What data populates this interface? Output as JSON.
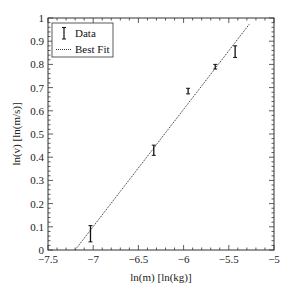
{
  "chart_data": {
    "type": "scatter",
    "title": "",
    "xlabel": "ln(m) [ln(kg)]",
    "ylabel": "ln(v) [ln(m/s)]",
    "xlim": [
      -7.5,
      -5
    ],
    "ylim": [
      0,
      1
    ],
    "x_ticks": [
      -7.5,
      -7,
      -6.5,
      -6,
      -5.5,
      -5
    ],
    "x_tick_labels": [
      "−7.5",
      "−7",
      "−6.5",
      "−6",
      "−5.5",
      "−5"
    ],
    "y_ticks": [
      0,
      0.1,
      0.2,
      0.3,
      0.4,
      0.5,
      0.6,
      0.7,
      0.8,
      0.9,
      1
    ],
    "y_tick_labels": [
      "0",
      "0.1",
      "0.2",
      "0.3",
      "0.4",
      "0.5",
      "0.6",
      "0.7",
      "0.8",
      "0.9",
      "1"
    ],
    "grid": false,
    "legend_position": "upper left",
    "series": [
      {
        "name": "Data",
        "style": "errorbar",
        "x": [
          -7.03,
          -6.33,
          -5.95,
          -5.65,
          -5.43
        ],
        "y": [
          0.07,
          0.43,
          0.685,
          0.79,
          0.855
        ],
        "yerr": [
          0.035,
          0.022,
          0.012,
          0.01,
          0.025
        ]
      },
      {
        "name": "Best Fit",
        "style": "dotted-line",
        "x": [
          -7.2,
          -5.27
        ],
        "y": [
          0.0,
          0.975
        ]
      }
    ]
  },
  "legend": {
    "items": [
      {
        "label": "Data"
      },
      {
        "label": "Best Fit"
      }
    ]
  },
  "axes": {
    "xlabel": "ln(m) [ln(kg)]",
    "ylabel": "ln(v) [ln(m/s)]"
  },
  "colors": {
    "axis": "#333333",
    "data": "#111111",
    "fit": "#222222"
  }
}
